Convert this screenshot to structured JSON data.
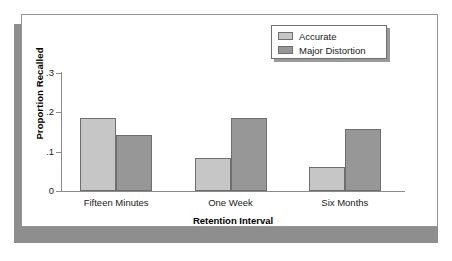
{
  "chart_data": {
    "type": "bar",
    "title": "",
    "xlabel": "Retention Interval",
    "ylabel": "Proportion Recalled",
    "categories": [
      "Fifteen Minutes",
      "One Week",
      "Six Months"
    ],
    "series": [
      {
        "name": "Accurate",
        "color": "#c6c6c6",
        "values": [
          0.185,
          0.083,
          0.062
        ]
      },
      {
        "name": "Major Distortion",
        "color": "#979797",
        "values": [
          0.143,
          0.186,
          0.158
        ]
      }
    ],
    "ylim": [
      0,
      0.3
    ],
    "ytick_values": [
      0,
      0.1,
      0.2,
      0.3
    ],
    "ytick_labels": [
      "0",
      ".1",
      ".2",
      ".3"
    ],
    "grid": false,
    "legend_position": "top-right",
    "legend_entries": [
      "Accurate",
      "Major Distortion"
    ]
  },
  "legend": {
    "items": [
      {
        "label": "Accurate",
        "swatch": "legend-swatch-accurate"
      },
      {
        "label": "Major Distortion",
        "swatch": "legend-swatch-major-distortion"
      }
    ]
  },
  "axes": {
    "y_title": "Proportion Recalled",
    "x_title": "Retention Interval",
    "y_labels": [
      "0",
      ".1",
      ".2",
      ".3"
    ],
    "x_labels": [
      "Fifteen Minutes",
      "One Week",
      "Six Months"
    ]
  },
  "colors": {
    "accurate": "#c6c6c6",
    "major_distortion": "#979797",
    "axis": "#8a8a8a",
    "bar_outline": "#6e6e6e",
    "frame": "#949494",
    "shadow": "#8e8e8e",
    "background": "#ffffff"
  }
}
